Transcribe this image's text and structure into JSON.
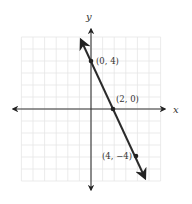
{
  "chart_data": {
    "type": "line",
    "title": "",
    "xlabel": "x",
    "ylabel": "y",
    "xlim": [
      -6,
      6
    ],
    "ylim": [
      -6,
      6
    ],
    "grid": true,
    "series": [
      {
        "name": "line",
        "equation": "y = -2x + 4",
        "x": [
          0,
          2,
          4
        ],
        "y": [
          4,
          0,
          -4
        ]
      }
    ],
    "points": [
      {
        "label": "(0, 4)",
        "x": 0,
        "y": 4
      },
      {
        "label": "(2, 0)",
        "x": 2,
        "y": 0
      },
      {
        "label": "(4, −4)",
        "x": 4,
        "y": -4
      }
    ]
  },
  "axes": {
    "x_label": "x",
    "y_label": "y"
  },
  "labels": {
    "p1": "(0, 4)",
    "p2": "(2, 0)",
    "p3": "(4, −4)"
  },
  "colors": {
    "line": "#2a2a2a",
    "grid": "#e6e6e6",
    "axis": "#333333"
  }
}
